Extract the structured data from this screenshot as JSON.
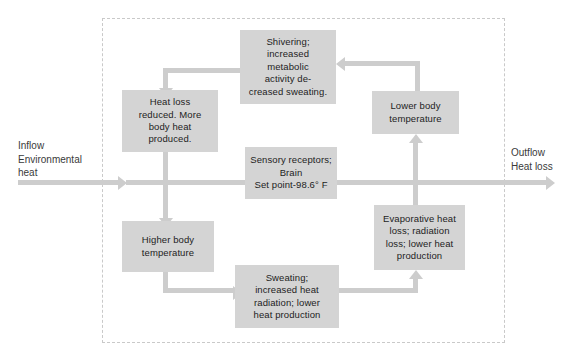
{
  "diagram": {
    "boundary_style": "dashed",
    "box_fill": "#d4d4d4",
    "connector_color": "#cdcdcd",
    "boundary_color": "#c9c9c9",
    "background": "#ffffff"
  },
  "labels": {
    "inflow": "Inflow\nEnvironmental\nheat",
    "outflow": "Outflow\nHeat loss"
  },
  "nodes": {
    "shivering": "Shivering;\nincreased\nmetabolic\nactivity de-\ncreased sweating.",
    "heat_loss_reduced": "Heat loss\nreduced. More\nbody heat\nproduced.",
    "lower_body_temperature": "Lower body\ntemperature",
    "sensory_receptors": "Sensory receptors;\nBrain\nSet point-98.6° F",
    "higher_body_temperature": "Higher body\ntemperature",
    "evaporative_heat_loss": "Evaporative heat\nloss; radiation\nloss; lower heat\nproduction",
    "sweating": "Sweating;\nincreased heat\nradiation; lower\nheat production"
  },
  "flow": {
    "edges": [
      {
        "from": "lower_body_temperature",
        "to": "shivering",
        "shape": "elbow-up-left",
        "arrow": "left"
      },
      {
        "from": "shivering",
        "to": "heat_loss_reduced",
        "shape": "elbow-left-down",
        "arrow": "down"
      },
      {
        "from": "heat_loss_reduced",
        "to": "higher_body_temperature",
        "shape": "straight-down",
        "arrow": "down"
      },
      {
        "from": "higher_body_temperature",
        "to": "sweating",
        "shape": "elbow-down-right",
        "arrow": "right"
      },
      {
        "from": "sweating",
        "to": "evaporative_heat_loss",
        "shape": "elbow-right-up",
        "arrow": "up"
      },
      {
        "from": "evaporative_heat_loss",
        "to": "lower_body_temperature",
        "shape": "straight-up",
        "arrow": "up"
      },
      {
        "from": "inflow",
        "to": "sensory_receptors",
        "shape": "horizontal",
        "arrow": "right"
      },
      {
        "from": "sensory_receptors",
        "to": "outflow",
        "shape": "horizontal",
        "arrow": "right"
      }
    ]
  }
}
